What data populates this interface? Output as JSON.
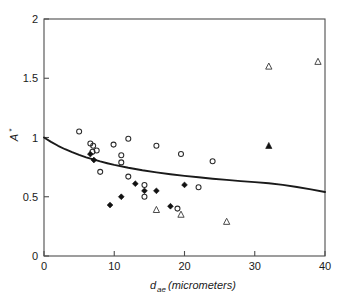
{
  "chart_data": {
    "type": "scatter",
    "title": "",
    "subtitle": "",
    "xlabel": "d_ae (micrometers)",
    "xlabel_base": "d",
    "xlabel_sub": "ae",
    "xlabel_rest": "(micrometers)",
    "ylabel": "A*",
    "ylabel_base": "A",
    "ylabel_sup": "*",
    "xlim": [
      0,
      40
    ],
    "ylim": [
      0,
      2
    ],
    "xticks": [
      0,
      10,
      20,
      30,
      40
    ],
    "xtick_labels": [
      "0",
      "10",
      "20",
      "30",
      "40"
    ],
    "yticks": [
      0,
      0.5,
      1,
      1.5,
      2
    ],
    "ytick_labels": [
      "0",
      "0.5",
      "1",
      "1.5",
      "2"
    ],
    "grid": false,
    "legend": "none",
    "series": [
      {
        "name": "open-circle",
        "marker": "open circle",
        "color": "#2b2b2b",
        "points": [
          [
            5.0,
            1.05
          ],
          [
            6.6,
            0.95
          ],
          [
            7.0,
            0.93
          ],
          [
            6.9,
            0.88
          ],
          [
            7.5,
            0.89
          ],
          [
            8.0,
            0.71
          ],
          [
            9.9,
            0.94
          ],
          [
            11.0,
            0.85
          ],
          [
            11.0,
            0.79
          ],
          [
            12.0,
            0.99
          ],
          [
            12.0,
            0.67
          ],
          [
            14.3,
            0.6
          ],
          [
            14.3,
            0.5
          ],
          [
            16.0,
            0.93
          ],
          [
            19.5,
            0.86
          ],
          [
            19.0,
            0.4
          ],
          [
            22.0,
            0.58
          ],
          [
            24.0,
            0.8
          ]
        ]
      },
      {
        "name": "filled-diamond",
        "marker": "filled diamond",
        "color": "#111111",
        "points": [
          [
            6.6,
            0.86
          ],
          [
            7.1,
            0.81
          ],
          [
            9.4,
            0.43
          ],
          [
            11.0,
            0.5
          ],
          [
            13.0,
            0.61
          ],
          [
            14.3,
            0.55
          ],
          [
            16.0,
            0.55
          ],
          [
            18.0,
            0.42
          ],
          [
            20.0,
            0.6
          ]
        ]
      },
      {
        "name": "open-triangle",
        "marker": "open triangle",
        "color": "#4a4a4a",
        "points": [
          [
            16.0,
            0.39
          ],
          [
            19.5,
            0.35
          ],
          [
            26.0,
            0.29
          ],
          [
            32.0,
            1.6
          ],
          [
            39.0,
            1.64
          ]
        ]
      },
      {
        "name": "filled-triangle",
        "marker": "filled triangle",
        "color": "#111111",
        "points": [
          [
            32.0,
            0.93
          ]
        ]
      }
    ],
    "fit_curve": {
      "name": "model-curve",
      "color": "#1a1a1a",
      "x": [
        0,
        1,
        2,
        3,
        4,
        5,
        6,
        7,
        8,
        9,
        10,
        12,
        14,
        16,
        18,
        20,
        22,
        24,
        26,
        28,
        30,
        32,
        34,
        36,
        38,
        40
      ],
      "y": [
        1.0,
        0.963,
        0.93,
        0.901,
        0.876,
        0.853,
        0.833,
        0.815,
        0.798,
        0.783,
        0.769,
        0.745,
        0.724,
        0.706,
        0.69,
        0.676,
        0.664,
        0.652,
        0.642,
        0.632,
        0.623,
        0.614,
        0.6,
        0.582,
        0.562,
        0.54
      ]
    }
  }
}
